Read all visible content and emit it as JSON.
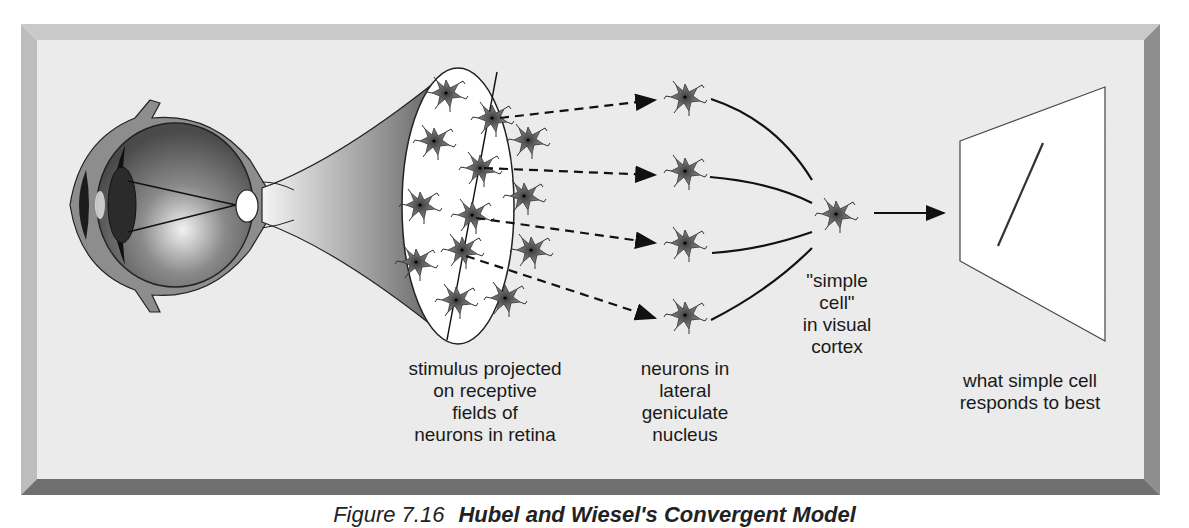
{
  "figure": {
    "caption_prefix": "Figure 7.16",
    "caption_title": "Hubel and Wiesel's Convergent Model"
  },
  "labels": {
    "retina": "stimulus projected\non receptive\nfields of\nneurons in retina",
    "lgn": "neurons in\nlateral\ngeniculate\nnucleus",
    "simple_cell": "\"simple\ncell\"\nin  visual\ncortex",
    "stimulus": "what simple cell\nresponds to best"
  },
  "diagram": {
    "stages": [
      "eye",
      "retinal receptive fields",
      "lateral geniculate nucleus neurons",
      "simple cell in visual cortex",
      "preferred stimulus (oriented line)"
    ],
    "lgn_neuron_count": 4,
    "retina_neuron_count": 16,
    "connections": "dashed arrows from retina to LGN; solid curves converging from LGN to simple cell; solid arrow to stimulus screen"
  },
  "colors": {
    "panel_bg": "#ebebeb",
    "neuron": "#6b6b6b",
    "line": "#111111"
  }
}
